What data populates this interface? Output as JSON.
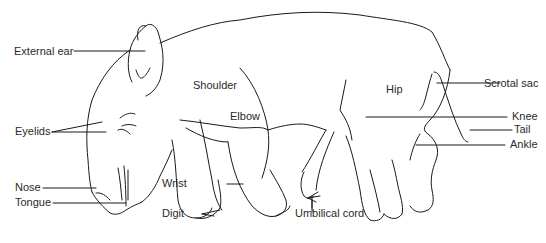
{
  "diagram": {
    "labels": {
      "external_ear": "External ear",
      "eyelids": "Eyelids",
      "nose": "Nose",
      "tongue": "Tongue",
      "shoulder": "Shoulder",
      "elbow": "Elbow",
      "wrist": "Wrist",
      "digit": "Digit",
      "umbilical_cord": "Umbilical cord",
      "hip": "Hip",
      "scrotal_sac": "Scrotal sac",
      "knee": "Knee",
      "tail": "Tail",
      "ankle": "Ankle"
    },
    "colors": {
      "line": "#1a1a1a",
      "text": "#2a2a2a",
      "background": "#ffffff"
    }
  }
}
